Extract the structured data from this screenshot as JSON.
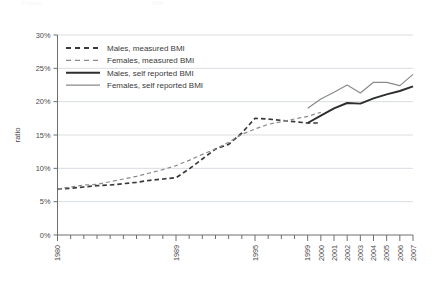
{
  "page": {
    "faint_header_left": "Figure",
    "faint_header_right": "BMI"
  },
  "chart_data": {
    "type": "line",
    "title": "",
    "subtitle": "",
    "xlabel": "",
    "ylabel": "ratio",
    "ylim": [
      0,
      30
    ],
    "y_unit": "%",
    "y_ticks": [
      "0%",
      "5%",
      "10%",
      "15%",
      "20%",
      "25%",
      "30%"
    ],
    "y_tick_values": [
      0,
      5,
      10,
      15,
      20,
      25,
      30
    ],
    "grid": "horizontal",
    "legend_position": "top-left",
    "xlim": [
      1980,
      2007
    ],
    "x_tick_values": [
      1980,
      1981,
      1982,
      1983,
      1984,
      1985,
      1986,
      1987,
      1988,
      1989,
      1990,
      1991,
      1992,
      1993,
      1994,
      1995,
      1996,
      1997,
      1998,
      1999,
      2000,
      2001,
      2002,
      2003,
      2004,
      2005,
      2006,
      2007
    ],
    "x_tick_labels": [
      "1980",
      "",
      "",
      "",
      "",
      "",
      "",
      "",
      "",
      "1989",
      "",
      "",
      "",
      "",
      "",
      "1995",
      "",
      "",
      "",
      "1999",
      "2000",
      "2001",
      "2002",
      "2003",
      "2004",
      "2005",
      "2006",
      "2007"
    ],
    "series": [
      {
        "name": "Males, measured BMI",
        "style": "dashed",
        "color": "#3a3a3a",
        "width": 1.7,
        "x": [
          1980,
          1981,
          1982,
          1983,
          1984,
          1985,
          1986,
          1987,
          1988,
          1989,
          1990,
          1991,
          1992,
          1993,
          1994,
          1995,
          1996,
          1997,
          1998,
          1999,
          2000
        ],
        "values": [
          6.9,
          7.0,
          7.2,
          7.4,
          7.5,
          7.7,
          7.9,
          8.2,
          8.4,
          8.6,
          9.9,
          11.4,
          12.9,
          13.6,
          15.3,
          17.5,
          17.4,
          17.2,
          17.0,
          16.8,
          16.8
        ]
      },
      {
        "name": "Females, measured BMI",
        "style": "dashed",
        "color": "#8a8a8a",
        "width": 1.2,
        "x": [
          1980,
          1981,
          1982,
          1983,
          1984,
          1985,
          1986,
          1987,
          1988,
          1989,
          1990,
          1991,
          1992,
          1993,
          1994,
          1995,
          1996,
          1997,
          1998,
          1999,
          2000
        ],
        "values": [
          6.9,
          7.2,
          7.5,
          7.6,
          8.0,
          8.4,
          8.8,
          9.3,
          9.8,
          10.4,
          11.2,
          12.1,
          12.9,
          13.9,
          15.1,
          15.9,
          16.6,
          17.0,
          17.4,
          17.8,
          18.4
        ]
      },
      {
        "name": "Males, self reported BMI",
        "style": "solid",
        "color": "#2e2e2e",
        "width": 1.9,
        "x": [
          1999,
          2000,
          2001,
          2002,
          2003,
          2004,
          2005,
          2006,
          2007
        ],
        "values": [
          16.8,
          17.9,
          19.0,
          19.8,
          19.7,
          20.5,
          21.1,
          21.6,
          22.3
        ]
      },
      {
        "name": "Females, self reported BMI",
        "style": "solid",
        "color": "#8a8a8a",
        "width": 1.2,
        "x": [
          1999,
          2000,
          2001,
          2002,
          2003,
          2004,
          2005,
          2006,
          2007
        ],
        "values": [
          19.0,
          20.4,
          21.4,
          22.5,
          21.3,
          22.9,
          22.9,
          22.4,
          24.1
        ]
      }
    ],
    "legend": [
      {
        "label": "Males, measured BMI",
        "style": "dashed",
        "color": "#3a3a3a",
        "width": 1.8
      },
      {
        "label": "Females, measured BMI",
        "style": "dashed",
        "color": "#8a8a8a",
        "width": 1.2
      },
      {
        "label": "Males, self reported BMI",
        "style": "solid",
        "color": "#2e2e2e",
        "width": 2.0
      },
      {
        "label": "Females, self reported BMI",
        "style": "solid",
        "color": "#8a8a8a",
        "width": 1.2
      }
    ]
  }
}
